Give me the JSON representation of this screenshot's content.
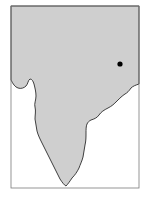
{
  "map": {
    "subject": "Indian subcontinent outline map",
    "colors": {
      "background": "#ffffff",
      "land": "#cfcfcf",
      "coastline": "#2b2b2b",
      "frame": "#7a7a7a",
      "marker": "#000000"
    },
    "frame": {
      "x": 11,
      "y": 6,
      "width": 128,
      "height": 182
    },
    "land_path": "M11,6 L139,6 L139,84 C136,85 133,86 131,88 C129,91 127,93 125,94 C122,96 120,98 117,101 C114,104 112,106 108,108 C104,110 101,112 99,115 C97,118 94,119 91,120 C89,121 88,122 87,124 C86,126 86,130 86,133 C86,137 86,141 85,145 C84,149 84,153 83,157 C82,161 80,165 79,168 C77,172 75,175 72,178 C70,181 68,184 66,186 C64,185 62,182 60,179 C58,175 56,171 54,167 C52,163 50,159 48,155 C46,151 44,147 42,143 C40,139 38,135 37,131 C36,127 36,123 35,119 C35,115 36,111 35,107 C34,104 36,100 36,96 C36,92 35,88 34,84 C33,81 32,79 30,79 C28,80 28,84 26,86 C24,88 21,89 18,88 C15,87 13,84 11,80 Z",
    "markers": [
      {
        "name": "location-dot",
        "cx": 120,
        "cy": 64,
        "r": 2.6
      }
    ]
  }
}
